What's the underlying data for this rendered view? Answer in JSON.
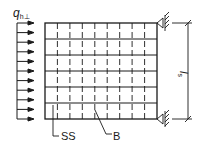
{
  "diagram": {
    "load_label": {
      "main": "q",
      "sub": "h⊥"
    },
    "span_label": {
      "main": "l",
      "sub": "s"
    },
    "callouts": [
      {
        "id": "ss",
        "text": "SS"
      },
      {
        "id": "b",
        "text": "B"
      }
    ],
    "grid": {
      "rows": 6,
      "cols": 9
    },
    "load_arrows": 11,
    "supports": [
      "top-right",
      "bottom-right"
    ],
    "colors": {
      "line": "#1a1a1a",
      "background": "#ffffff"
    }
  }
}
